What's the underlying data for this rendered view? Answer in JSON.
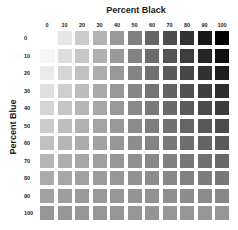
{
  "chart_data": {
    "type": "heatmap",
    "title": "Percent Black",
    "xlabel": "Percent Black",
    "ylabel": "Percent Blue",
    "x_ticks": [
      "0",
      "10",
      "20",
      "30",
      "40",
      "50",
      "60",
      "70",
      "80",
      "90",
      "100"
    ],
    "y_ticks": [
      "0",
      "10",
      "20",
      "30",
      "40",
      "50",
      "60",
      "70",
      "80",
      "90",
      "100"
    ]
  },
  "labels": {
    "x_title": "Percent Black",
    "y_title": "Percent Blue"
  }
}
